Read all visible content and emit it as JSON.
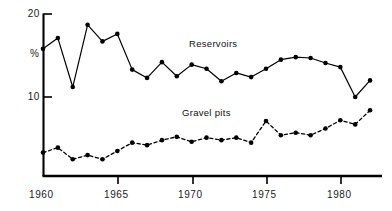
{
  "chart_data": {
    "type": "line",
    "title": "",
    "subtitle": "",
    "xlabel": "",
    "ylabel": "%",
    "x": [
      1960,
      1961,
      1962,
      1963,
      1964,
      1965,
      1966,
      1967,
      1968,
      1969,
      1970,
      1971,
      1972,
      1973,
      1974,
      1975,
      1976,
      1977,
      1978,
      1979,
      1980,
      1981,
      1982
    ],
    "xlim": [
      1959.6,
      1982.6
    ],
    "ylim": [
      0.0,
      20.6
    ],
    "grid": false,
    "legend_position": "inline-annotation",
    "x_tick_values": [
      1960,
      1965,
      1970,
      1975,
      1980
    ],
    "x_tick_labels": [
      "1960",
      "1965",
      "1970",
      "1975",
      "1980"
    ],
    "y_tick_values": [
      10,
      20
    ],
    "y_tick_labels": [
      "10",
      "20"
    ],
    "series": [
      {
        "name": "Reservoirs",
        "line_style": "solid",
        "marker": "filled-circle",
        "color": "#000000",
        "label_x": 1971.4,
        "label_y": 16.6,
        "values": [
          15.8,
          17.1,
          11.2,
          18.7,
          16.7,
          17.6,
          13.3,
          12.3,
          14.2,
          12.5,
          13.9,
          13.4,
          11.9,
          12.9,
          12.4,
          13.4,
          14.5,
          14.8,
          14.7,
          14.1,
          13.6,
          10.0,
          12.0
        ]
      },
      {
        "name": "Gravel pits",
        "line_style": "dashed",
        "marker": "filled-circle",
        "color": "#000000",
        "label_x": 1970.2,
        "label_y": 8.4,
        "values": [
          3.3,
          3.9,
          2.5,
          3.0,
          2.5,
          3.5,
          4.5,
          4.2,
          4.8,
          5.2,
          4.6,
          5.1,
          4.8,
          5.1,
          4.5,
          7.1,
          5.4,
          5.7,
          5.4,
          6.2,
          7.2,
          6.7,
          8.4
        ]
      }
    ]
  }
}
